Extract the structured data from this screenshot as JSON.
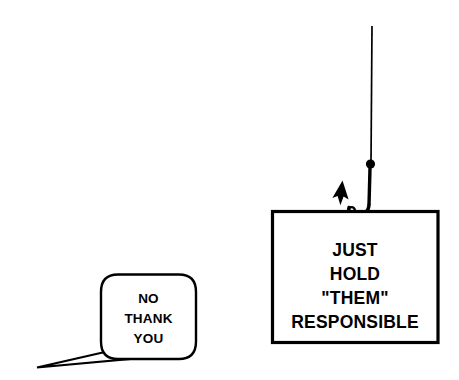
{
  "canvas": {
    "width": 459,
    "height": 380,
    "background_color": "#ffffff",
    "ink_color": "#000000"
  },
  "sign": {
    "name": "placard",
    "lines": [
      "JUST",
      "HOLD",
      "\"THEM\"",
      "RESPONSIBLE"
    ],
    "border_color": "#000000",
    "fill_color": "#ffffff"
  },
  "speech_bubble": {
    "name": "speech-bubble",
    "lines": [
      "NO",
      "THANK",
      "YOU"
    ],
    "border_color": "#000000",
    "fill_color": "#ffffff"
  },
  "fishing_rig": {
    "line_label": "fishing-line",
    "bead_label": "line-bead",
    "hook_label": "fish-hook",
    "barb_label": "hook-barb",
    "color": "#000000"
  }
}
